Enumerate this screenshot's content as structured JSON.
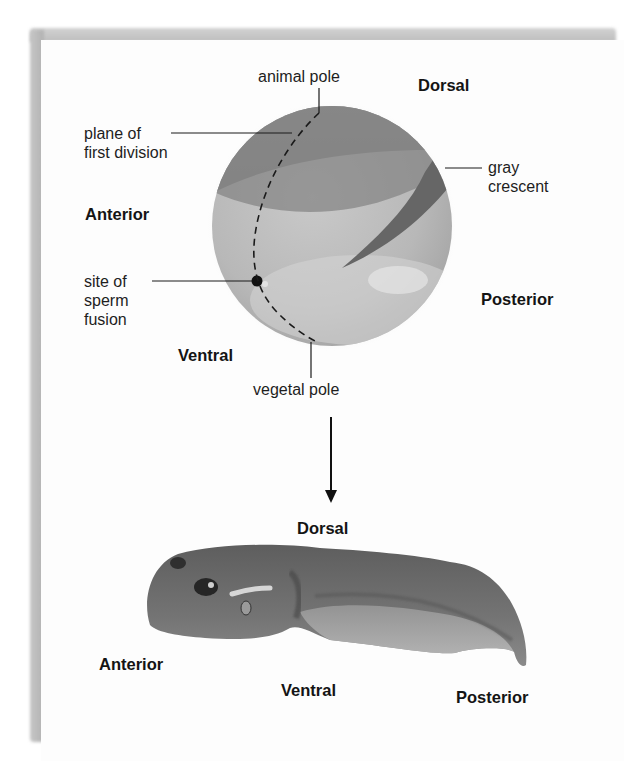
{
  "figure": {
    "egg": {
      "labels": {
        "animal_pole": "animal pole",
        "plane_of_first_division": "plane of\nfirst division",
        "gray_crescent": "gray\ncrescent",
        "site_of_sperm_fusion": "site of\nsperm\nfusion",
        "vegetal_pole": "vegetal pole"
      },
      "axes": {
        "dorsal": "Dorsal",
        "anterior": "Anterior",
        "posterior": "Posterior",
        "ventral": "Ventral"
      }
    },
    "tadpole": {
      "axes": {
        "dorsal": "Dorsal",
        "anterior": "Anterior",
        "ventral": "Ventral",
        "posterior": "Posterior"
      }
    },
    "colors": {
      "egg_dark": "#8a8a8a",
      "egg_light": "#c4c4c4",
      "gray_crescent": "#6a6a6a",
      "tadpole": "#6e6e6e"
    }
  }
}
